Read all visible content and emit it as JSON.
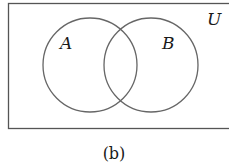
{
  "diagram": {
    "type": "venn",
    "universe_label": "U",
    "sets": [
      {
        "label": "A"
      },
      {
        "label": "B"
      }
    ],
    "caption": "(b)",
    "colors": {
      "stroke": "#555555",
      "text": "#1a1a1a",
      "background": "#ffffff"
    }
  }
}
